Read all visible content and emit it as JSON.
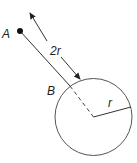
{
  "diagram": {
    "labels": {
      "point_a": "A",
      "point_b": "B",
      "distance": "2r",
      "radius": "r"
    },
    "colors": {
      "stroke": "#444444",
      "dot": "#111111",
      "text": "#222222"
    }
  }
}
